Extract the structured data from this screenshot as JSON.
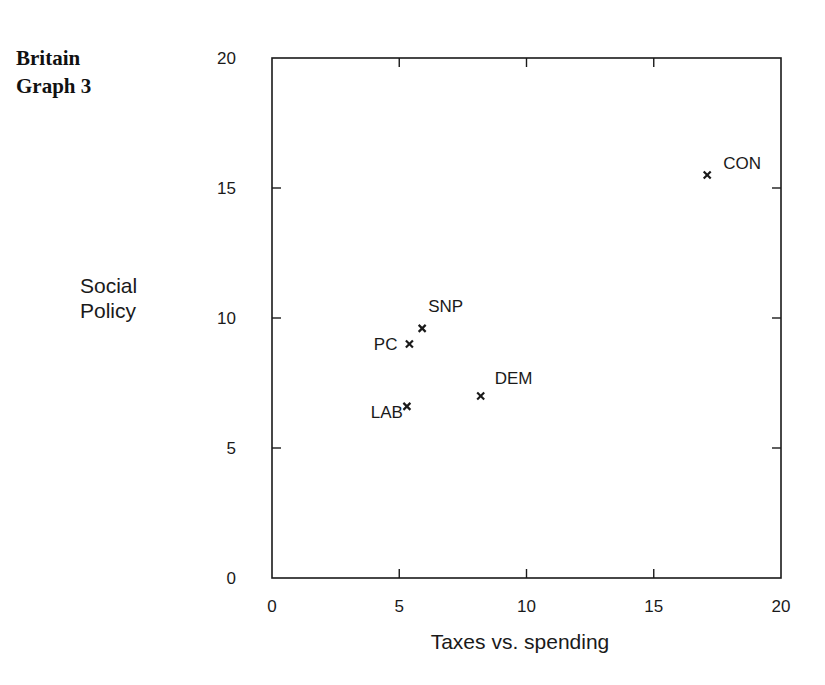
{
  "title_lines": [
    "Britain",
    "Graph 3"
  ],
  "chart_data": {
    "type": "scatter",
    "title": "Britain Graph 3",
    "xlabel": "Taxes vs. spending",
    "ylabel": "Social Policy",
    "xlim": [
      0,
      20
    ],
    "ylim": [
      0,
      20
    ],
    "xticks": [
      0,
      5,
      10,
      15,
      20
    ],
    "yticks": [
      0,
      5,
      10,
      15,
      20
    ],
    "grid": false,
    "marker": "x",
    "points": [
      {
        "label": "CON",
        "x": 17.1,
        "y": 15.5
      },
      {
        "label": "SNP",
        "x": 5.9,
        "y": 9.6
      },
      {
        "label": "PC",
        "x": 5.4,
        "y": 9.0
      },
      {
        "label": "DEM",
        "x": 8.2,
        "y": 7.0
      },
      {
        "label": "LAB",
        "x": 5.3,
        "y": 6.6
      }
    ]
  },
  "ylabel_lines": [
    "Social",
    "Policy"
  ]
}
